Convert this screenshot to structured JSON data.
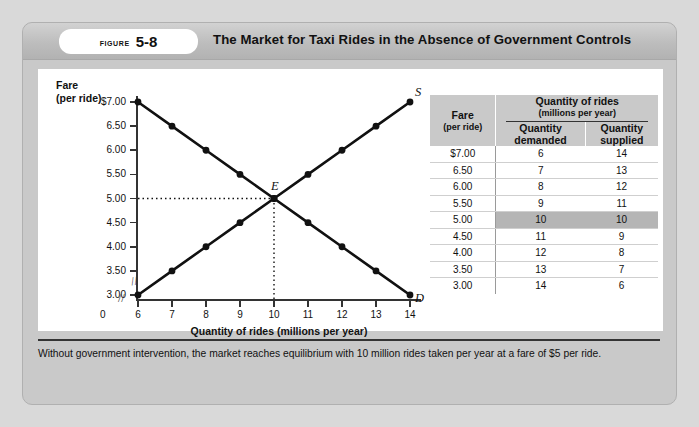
{
  "figure": {
    "label_word": "FIGURE",
    "number": "5-8",
    "title": "The Market for Taxi Rides in the Absence of Government Controls"
  },
  "chart_data": {
    "type": "line",
    "title": "",
    "xlabel": "Quantity of rides (millions per year)",
    "ylabel": "Fare",
    "ylabel_sub": "(per ride)",
    "x": [
      6,
      7,
      8,
      9,
      10,
      11,
      12,
      13,
      14
    ],
    "xtick_labels": [
      "6",
      "7",
      "8",
      "9",
      "10",
      "11",
      "12",
      "13",
      "14"
    ],
    "origin_label": "0",
    "ytick_labels": [
      "$7.00",
      "6.50",
      "6.00",
      "5.50",
      "5.00",
      "4.50",
      "4.00",
      "3.50",
      "3.00"
    ],
    "ytick_values": [
      7.0,
      6.5,
      6.0,
      5.5,
      5.0,
      4.5,
      4.0,
      3.5,
      3.0
    ],
    "ylim": [
      3.0,
      7.0
    ],
    "xlim": [
      6,
      14
    ],
    "axis_break": true,
    "grid": false,
    "series": [
      {
        "name": "D",
        "label": "D",
        "description": "Demand curve",
        "points": [
          {
            "x": 6,
            "y": 7.0
          },
          {
            "x": 7,
            "y": 6.5
          },
          {
            "x": 8,
            "y": 6.0
          },
          {
            "x": 9,
            "y": 5.5
          },
          {
            "x": 10,
            "y": 5.0
          },
          {
            "x": 11,
            "y": 4.5
          },
          {
            "x": 12,
            "y": 4.0
          },
          {
            "x": 13,
            "y": 3.5
          },
          {
            "x": 14,
            "y": 3.0
          }
        ]
      },
      {
        "name": "S",
        "label": "S",
        "description": "Supply curve",
        "points": [
          {
            "x": 6,
            "y": 3.0
          },
          {
            "x": 7,
            "y": 3.5
          },
          {
            "x": 8,
            "y": 4.0
          },
          {
            "x": 9,
            "y": 4.5
          },
          {
            "x": 10,
            "y": 5.0
          },
          {
            "x": 11,
            "y": 5.5
          },
          {
            "x": 12,
            "y": 6.0
          },
          {
            "x": 13,
            "y": 6.5
          },
          {
            "x": 14,
            "y": 7.0
          }
        ]
      }
    ],
    "annotations": [
      {
        "label": "E",
        "x": 10,
        "y": 5.0,
        "description": "equilibrium point"
      }
    ]
  },
  "table": {
    "group_header": "Quantity of rides",
    "group_header_sub": "(millions per year)",
    "fare_header": "Fare",
    "fare_header_sub": "(per ride)",
    "col_demanded": "Quantity",
    "col_demanded_sub": "demanded",
    "col_supplied": "Quantity",
    "col_supplied_sub": "supplied",
    "rows": [
      {
        "fare": "$7.00",
        "demanded": "6",
        "supplied": "14",
        "highlight": false
      },
      {
        "fare": "6.50",
        "demanded": "7",
        "supplied": "13",
        "highlight": false
      },
      {
        "fare": "6.00",
        "demanded": "8",
        "supplied": "12",
        "highlight": false
      },
      {
        "fare": "5.50",
        "demanded": "9",
        "supplied": "11",
        "highlight": false
      },
      {
        "fare": "5.00",
        "demanded": "10",
        "supplied": "10",
        "highlight": true
      },
      {
        "fare": "4.50",
        "demanded": "11",
        "supplied": "9",
        "highlight": false
      },
      {
        "fare": "4.00",
        "demanded": "12",
        "supplied": "8",
        "highlight": false
      },
      {
        "fare": "3.50",
        "demanded": "13",
        "supplied": "7",
        "highlight": false
      },
      {
        "fare": "3.00",
        "demanded": "14",
        "supplied": "6",
        "highlight": false
      }
    ]
  },
  "caption": {
    "text": "Without government intervention, the market reaches equilibrium with 10 million rides taken per year at a fare of $5 per ride."
  },
  "colors": {
    "page_background": "#d9d9d9",
    "card_background": "#c9c9c9",
    "panel_background": "#ffffff",
    "curve": "#111111",
    "highlight_row": "#b5b5b5"
  }
}
